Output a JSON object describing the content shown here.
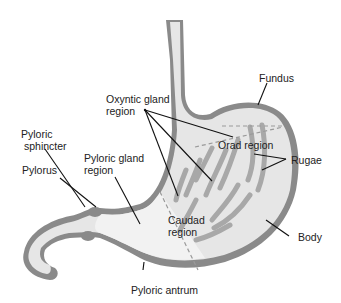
{
  "diagram": {
    "colors": {
      "wall": "#8a8a8a",
      "lumen": "#e6e6e6",
      "lumen_antrum": "#f2f2f2",
      "rugae": "#a8a8a8",
      "leader_line": "#111111",
      "dashed_divider": "#9a9a9a",
      "text": "#222222"
    },
    "labels": {
      "fundus": "Fundus",
      "oxyntic_line1": "Oxyntic gland",
      "oxyntic_line2": "region",
      "orad_region": "Orad region",
      "rugae": "Rugae",
      "pyloric_sphincter_line1": "Pyloric",
      "pyloric_sphincter_line2": "sphincter",
      "pyloric_gland_line1": "Pyloric gland",
      "pyloric_gland_line2": "region",
      "pylorus": "Pylorus",
      "caudad_line1": "Caudad",
      "caudad_line2": "region",
      "body": "Body",
      "pyloric_antrum": "Pyloric antrum"
    }
  }
}
